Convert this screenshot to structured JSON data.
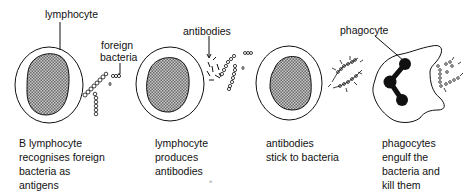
{
  "diagram": {
    "labels": {
      "lymphocyte": "lymphocyte",
      "foreign_bacteria_1": "foreign",
      "foreign_bacteria_2": "bacteria",
      "antibodies": "antibodies",
      "phagocyte": "phagocyte"
    },
    "captions": [
      {
        "lines": [
          "B lymphocyte",
          "recognises foreign",
          "bacteria as",
          "antigens"
        ]
      },
      {
        "lines": [
          "lymphocyte",
          "produces",
          "antibodies"
        ]
      },
      {
        "lines": [
          "antibodies",
          "stick to bacteria"
        ]
      },
      {
        "lines": [
          "phagocytes",
          "engulf the",
          "bacteria and",
          "kill them"
        ]
      }
    ],
    "colors": {
      "ink": "#111111",
      "nucleus_fill": "#9a9a9a",
      "background": "#ffffff"
    }
  }
}
